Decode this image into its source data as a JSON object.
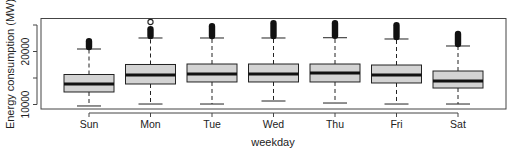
{
  "chart_data": {
    "type": "boxplot",
    "title": "",
    "title_note": "title cropped at top edge, not legible",
    "xlabel": "weekday",
    "ylabel": "Energy consumption (MW)",
    "categories": [
      "Sun",
      "Mon",
      "Tue",
      "Wed",
      "Thu",
      "Fri",
      "Sat"
    ],
    "ylim": [
      9200,
      26400
    ],
    "yticks": [
      10000,
      15000,
      20000,
      25000
    ],
    "ytick_labels": [
      "10000",
      "",
      "20000",
      ""
    ],
    "grid": false,
    "legend": null,
    "box_fill": "#d3d3d3",
    "stroke": "#222222",
    "boxes": [
      {
        "label": "Sun",
        "whisker_low": 9720,
        "q1": 12360,
        "median": 13870,
        "q3": 15660,
        "whisker_high": 20470,
        "outliers_range": [
          20600,
          22170
        ],
        "open_outliers": []
      },
      {
        "label": "Mon",
        "whisker_low": 10090,
        "q1": 13870,
        "median": 15570,
        "q3": 17550,
        "whisker_high": 22550,
        "outliers_range": [
          22700,
          24430
        ],
        "open_outliers": [
          25570
        ]
      },
      {
        "label": "Tue",
        "whisker_low": 10090,
        "q1": 14250,
        "median": 15750,
        "q3": 17640,
        "whisker_high": 22550,
        "outliers_range": [
          22700,
          25000
        ],
        "open_outliers": []
      },
      {
        "label": "Wed",
        "whisker_low": 10660,
        "q1": 14250,
        "median": 15750,
        "q3": 17640,
        "whisker_high": 22550,
        "outliers_range": [
          22700,
          25570
        ],
        "open_outliers": []
      },
      {
        "label": "Thu",
        "whisker_low": 10280,
        "q1": 14250,
        "median": 15940,
        "q3": 17640,
        "whisker_high": 22600,
        "outliers_range": [
          22750,
          25570
        ],
        "open_outliers": []
      },
      {
        "label": "Fri",
        "whisker_low": 10090,
        "q1": 14060,
        "median": 15570,
        "q3": 17450,
        "whisker_high": 22360,
        "outliers_range": [
          22500,
          25190
        ],
        "open_outliers": []
      },
      {
        "label": "Sat",
        "whisker_low": 10090,
        "q1": 13110,
        "median": 14430,
        "q3": 16320,
        "whisker_high": 21040,
        "outliers_range": [
          21200,
          23550
        ],
        "open_outliers": []
      }
    ]
  }
}
